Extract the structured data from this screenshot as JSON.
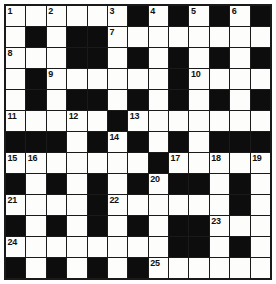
{
  "puzzle": {
    "title": "Crossword Grid",
    "rows": 13,
    "columns": 13,
    "colors": {
      "block": "#0d0d0d",
      "cell": "#fdfdfb",
      "grid_line": "#1a1a1a",
      "number_text": "#111111",
      "page_background": "#ffffff"
    },
    "legend": {
      "white": "open letter cell",
      "black": "blocked cell"
    },
    "grid": [
      [
        "W",
        "W",
        "W",
        "W",
        "W",
        "W",
        "B",
        "W",
        "B",
        "W",
        "B",
        "W",
        "B"
      ],
      [
        "W",
        "B",
        "W",
        "B",
        "B",
        "W",
        "W",
        "W",
        "W",
        "W",
        "W",
        "W",
        "W"
      ],
      [
        "W",
        "W",
        "W",
        "B",
        "B",
        "W",
        "B",
        "W",
        "B",
        "W",
        "B",
        "W",
        "B"
      ],
      [
        "W",
        "B",
        "W",
        "W",
        "W",
        "W",
        "W",
        "W",
        "B",
        "W",
        "W",
        "W",
        "W"
      ],
      [
        "W",
        "B",
        "W",
        "B",
        "B",
        "W",
        "B",
        "W",
        "B",
        "W",
        "B",
        "W",
        "B"
      ],
      [
        "W",
        "W",
        "W",
        "W",
        "W",
        "B",
        "W",
        "W",
        "W",
        "W",
        "W",
        "W",
        "W"
      ],
      [
        "B",
        "B",
        "B",
        "W",
        "B",
        "W",
        "B",
        "W",
        "B",
        "W",
        "B",
        "B",
        "B"
      ],
      [
        "W",
        "W",
        "W",
        "W",
        "W",
        "W",
        "W",
        "B",
        "W",
        "W",
        "W",
        "W",
        "W"
      ],
      [
        "B",
        "W",
        "B",
        "W",
        "B",
        "W",
        "B",
        "W",
        "B",
        "B",
        "W",
        "B",
        "W"
      ],
      [
        "W",
        "W",
        "W",
        "W",
        "B",
        "W",
        "W",
        "W",
        "W",
        "W",
        "W",
        "B",
        "W"
      ],
      [
        "B",
        "W",
        "B",
        "W",
        "B",
        "W",
        "B",
        "W",
        "B",
        "B",
        "W",
        "W",
        "W"
      ],
      [
        "W",
        "W",
        "W",
        "W",
        "W",
        "W",
        "W",
        "W",
        "B",
        "B",
        "W",
        "B",
        "W"
      ],
      [
        "B",
        "W",
        "B",
        "W",
        "B",
        "W",
        "B",
        "W",
        "W",
        "W",
        "W",
        "W",
        "W"
      ]
    ],
    "numbers": [
      {
        "row": 0,
        "col": 0,
        "label": "1"
      },
      {
        "row": 0,
        "col": 2,
        "label": "2"
      },
      {
        "row": 0,
        "col": 5,
        "label": "3"
      },
      {
        "row": 0,
        "col": 7,
        "label": "4"
      },
      {
        "row": 0,
        "col": 9,
        "label": "5"
      },
      {
        "row": 0,
        "col": 11,
        "label": "6"
      },
      {
        "row": 1,
        "col": 5,
        "label": "7"
      },
      {
        "row": 2,
        "col": 0,
        "label": "8"
      },
      {
        "row": 3,
        "col": 2,
        "label": "9"
      },
      {
        "row": 3,
        "col": 9,
        "label": "10"
      },
      {
        "row": 5,
        "col": 0,
        "label": "11"
      },
      {
        "row": 5,
        "col": 3,
        "label": "12"
      },
      {
        "row": 5,
        "col": 6,
        "label": "13"
      },
      {
        "row": 6,
        "col": 5,
        "label": "14"
      },
      {
        "row": 7,
        "col": 0,
        "label": "15"
      },
      {
        "row": 7,
        "col": 1,
        "label": "16"
      },
      {
        "row": 7,
        "col": 8,
        "label": "17"
      },
      {
        "row": 7,
        "col": 10,
        "label": "18"
      },
      {
        "row": 7,
        "col": 12,
        "label": "19"
      },
      {
        "row": 8,
        "col": 7,
        "label": "20"
      },
      {
        "row": 9,
        "col": 0,
        "label": "21"
      },
      {
        "row": 9,
        "col": 5,
        "label": "22"
      },
      {
        "row": 10,
        "col": 10,
        "label": "23"
      },
      {
        "row": 11,
        "col": 0,
        "label": "24"
      },
      {
        "row": 12,
        "col": 7,
        "label": "25"
      }
    ]
  }
}
